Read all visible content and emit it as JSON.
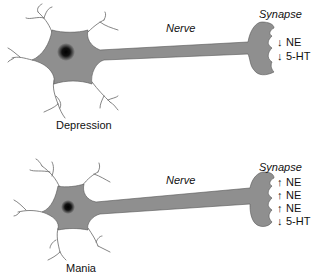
{
  "panels": [
    {
      "state_label": "Depression",
      "nerve_label": "Nerve",
      "synapse_label": "Synapse",
      "neurotransmitters": [
        {
          "direction": "down",
          "arrow": "↓",
          "name": "NE"
        },
        {
          "direction": "down",
          "arrow": "↓",
          "name": "5-HT"
        }
      ]
    },
    {
      "state_label": "Mania",
      "nerve_label": "Nerve",
      "synapse_label": "Synapse",
      "neurotransmitters": [
        {
          "direction": "up",
          "arrow": "↑",
          "name": "NE"
        },
        {
          "direction": "up",
          "arrow": "↑",
          "name": "NE"
        },
        {
          "direction": "up",
          "arrow": "↑",
          "name": "NE"
        },
        {
          "direction": "down",
          "arrow": "↓",
          "name": "5-HT"
        }
      ]
    }
  ],
  "colors": {
    "cell_fill": "#8f8f8f",
    "cell_outline": "#555555",
    "nucleus": "#000000",
    "dendrite": "#666666",
    "text": "#111111"
  }
}
